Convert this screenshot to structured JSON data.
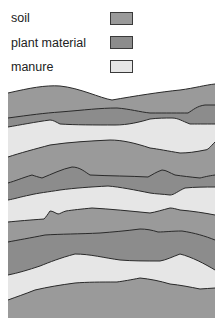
{
  "legend": {
    "items": [
      {
        "label": "soil",
        "color": "#9a9a9a"
      },
      {
        "label": "plant material",
        "color": "#8c8c8c"
      },
      {
        "label": "manure",
        "color": "#e6e6e6"
      }
    ]
  },
  "diagram": {
    "layer_order_top_to_bottom": [
      "soil",
      "plant material",
      "manure",
      "soil",
      "plant material",
      "manure",
      "soil",
      "plant material",
      "manure",
      "soil"
    ],
    "colors": {
      "soil": "#9a9a9a",
      "plant_material": "#8c8c8c",
      "manure": "#e6e6e6",
      "line": "#2a2a2a"
    }
  }
}
